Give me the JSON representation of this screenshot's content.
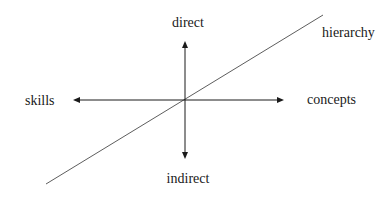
{
  "diagram": {
    "type": "conceptual-axes",
    "labels": {
      "top": "direct",
      "bottom": "indirect",
      "left": "skills",
      "right": "concepts",
      "diagonal": "hierarchy"
    },
    "colors": {
      "line": "#1a1a1a",
      "diagonal": "#333333",
      "background": "#ffffff"
    }
  }
}
